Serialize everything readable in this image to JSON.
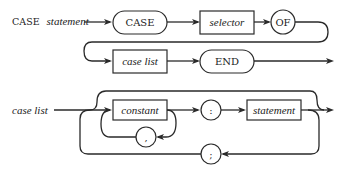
{
  "diagram": {
    "case_statement": {
      "label_keyword": "CASE",
      "label_rest": "statement",
      "nodes": [
        {
          "id": "case",
          "kind": "terminal-pill",
          "text": "CASE"
        },
        {
          "id": "selector",
          "kind": "nonterminal-box",
          "text": "selector"
        },
        {
          "id": "of",
          "kind": "terminal-circle",
          "text": "OF"
        },
        {
          "id": "case_list",
          "kind": "nonterminal-box",
          "text": "case list"
        },
        {
          "id": "end",
          "kind": "terminal-pill",
          "text": "END"
        }
      ]
    },
    "case_list": {
      "label": "case list",
      "nodes": [
        {
          "id": "constant",
          "kind": "nonterminal-box",
          "text": "constant"
        },
        {
          "id": "comma",
          "kind": "terminal-circle",
          "text": ","
        },
        {
          "id": "colon",
          "kind": "terminal-circle",
          "text": ":"
        },
        {
          "id": "statement",
          "kind": "nonterminal-box",
          "text": "statement"
        },
        {
          "id": "semicolon",
          "kind": "terminal-circle",
          "text": ";"
        }
      ]
    }
  }
}
